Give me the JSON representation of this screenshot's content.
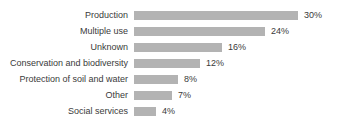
{
  "chart_data": {
    "type": "bar",
    "orientation": "horizontal",
    "title": "",
    "subtitle": "",
    "xlabel": "",
    "ylabel": "",
    "categories": [
      "Production",
      "Multiple use",
      "Unknown",
      "Conservation and biodiversity",
      "Protection of soil and water",
      "Other",
      "Social services"
    ],
    "values": [
      30,
      24,
      16,
      12,
      8,
      7,
      4
    ],
    "value_labels": [
      "30%",
      "24%",
      "16%",
      "12%",
      "8%",
      "7%",
      "4%"
    ],
    "unit": "%",
    "xlim": [
      0,
      30
    ],
    "grid": false,
    "legend": false,
    "axis_visible": false,
    "bar_color": "#b3b3b3",
    "text_color": "#3a3a3a",
    "background_color": "#ffffff"
  },
  "rows": [
    {
      "label": "Production",
      "value": 30,
      "value_label": "30%",
      "bar_px": 164
    },
    {
      "label": "Multiple use",
      "value": 24,
      "value_label": "24%",
      "bar_px": 131
    },
    {
      "label": "Unknown",
      "value": 16,
      "value_label": "16%",
      "bar_px": 88
    },
    {
      "label": "Conservation and biodiversity",
      "value": 12,
      "value_label": "12%",
      "bar_px": 66
    },
    {
      "label": "Protection of soil and water",
      "value": 8,
      "value_label": "8%",
      "bar_px": 44
    },
    {
      "label": "Other",
      "value": 7,
      "value_label": "7%",
      "bar_px": 38
    },
    {
      "label": "Social services",
      "value": 4,
      "value_label": "4%",
      "bar_px": 22
    }
  ]
}
